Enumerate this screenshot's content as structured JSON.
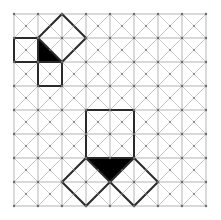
{
  "diagram": {
    "title": "",
    "grid": {
      "origin": [
        14,
        14
      ],
      "cell_size": 24,
      "cols": 8,
      "rows": 8,
      "cell_diagonals": true,
      "vertex_dots": true,
      "line_color": "#b4b4b4",
      "dot_color": "#6a6a6a"
    },
    "shapes": [
      {
        "name": "top-diamond",
        "kind": "outline",
        "points": [
          [
            2,
            0
          ],
          [
            3,
            1
          ],
          [
            2,
            2
          ],
          [
            1,
            1
          ]
        ]
      },
      {
        "name": "top-left-square",
        "kind": "outline",
        "points": [
          [
            0,
            1
          ],
          [
            1,
            1
          ],
          [
            1,
            2
          ],
          [
            0,
            2
          ]
        ]
      },
      {
        "name": "top-lower-square",
        "kind": "outline",
        "points": [
          [
            1,
            2
          ],
          [
            2,
            2
          ],
          [
            2,
            3
          ],
          [
            1,
            3
          ]
        ]
      },
      {
        "name": "top-black-triangle",
        "kind": "filled",
        "points": [
          [
            1,
            1
          ],
          [
            2,
            2
          ],
          [
            1,
            2
          ]
        ]
      },
      {
        "name": "bottom-large-square",
        "kind": "outline",
        "points": [
          [
            3,
            4
          ],
          [
            5,
            4
          ],
          [
            5,
            6
          ],
          [
            3,
            6
          ]
        ]
      },
      {
        "name": "bottom-black-triangle",
        "kind": "filled",
        "points": [
          [
            3,
            6
          ],
          [
            5,
            6
          ],
          [
            4,
            7
          ]
        ]
      },
      {
        "name": "bottom-left-diamond",
        "kind": "outline",
        "points": [
          [
            3,
            6
          ],
          [
            4,
            7
          ],
          [
            3,
            8
          ],
          [
            2,
            7
          ]
        ]
      },
      {
        "name": "bottom-right-diamond",
        "kind": "outline",
        "points": [
          [
            5,
            6
          ],
          [
            6,
            7
          ],
          [
            5,
            8
          ],
          [
            4,
            7
          ]
        ]
      }
    ],
    "outline_color": "#2a2a2a",
    "fill_color": "#000000"
  }
}
